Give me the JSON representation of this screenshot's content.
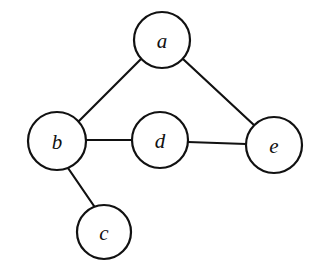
{
  "diagram": {
    "background_color": "#ffffff",
    "stroke_color": "#111111",
    "node_fill_color": "#ffffff",
    "nodes": [
      {
        "id": "a",
        "label": "a",
        "cx": 162,
        "cy": 40,
        "r": 28
      },
      {
        "id": "b",
        "label": "b",
        "cx": 57,
        "cy": 141,
        "r": 29
      },
      {
        "id": "c",
        "label": "c",
        "cx": 104,
        "cy": 232,
        "r": 27
      },
      {
        "id": "d",
        "label": "d",
        "cx": 160,
        "cy": 140,
        "r": 28
      },
      {
        "id": "e",
        "label": "e",
        "cx": 274,
        "cy": 145,
        "r": 28
      }
    ],
    "edges": [
      {
        "id": "edge-a-b",
        "from": "a",
        "to": "b",
        "x1": 141,
        "y1": 59,
        "x2": 78,
        "y2": 122
      },
      {
        "id": "edge-a-e",
        "from": "a",
        "to": "e",
        "x1": 183,
        "y1": 59,
        "x2": 255,
        "y2": 126
      },
      {
        "id": "edge-b-d",
        "from": "b",
        "to": "d",
        "x1": 86,
        "y1": 140,
        "x2": 132,
        "y2": 140
      },
      {
        "id": "edge-d-e",
        "from": "d",
        "to": "e",
        "x1": 188,
        "y1": 142,
        "x2": 246,
        "y2": 144
      },
      {
        "id": "edge-b-c",
        "from": "b",
        "to": "c",
        "x1": 68,
        "y1": 168,
        "x2": 94,
        "y2": 206
      }
    ]
  }
}
